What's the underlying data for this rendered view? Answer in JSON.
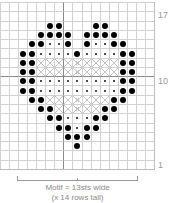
{
  "chart_data": {
    "type": "table",
    "columns": 17,
    "rows": 18,
    "row_labels": [
      {
        "row": 17,
        "label": "17"
      },
      {
        "row": 10,
        "label": "10"
      },
      {
        "row": 1,
        "label": "1"
      }
    ],
    "legend": {
      "B": "large filled dot",
      "s": "small dot",
      "x": "cross (light X)",
      ".": "empty"
    },
    "grid_rows_top_to_bottom": [
      {
        "row": 18,
        "cells": "................."
      },
      {
        "row": 17,
        "cells": "................."
      },
      {
        "row": 16,
        "cells": ".....BB...BB....."
      },
      {
        "row": 15,
        "cells": "....BBBB.BBBB...."
      },
      {
        "row": 14,
        "cells": "...BBssB.BssBB..."
      },
      {
        "row": 13,
        "cells": "..BBssssBssssBB.."
      },
      {
        "row": 12,
        "cells": "..BBxxxxxxxxxBB.."
      },
      {
        "row": 11,
        "cells": "..BBxxxxxxxxxBB.."
      },
      {
        "row": 10,
        "cells": "..BBsssssssssBB.."
      },
      {
        "row": 9,
        "cells": "..BBsssssssssBB.."
      },
      {
        "row": 8,
        "cells": "...BBxxxxxxxBB..."
      },
      {
        "row": 7,
        "cells": "....BBxxxxxBB...."
      },
      {
        "row": 6,
        "cells": ".....BBsssBB....."
      },
      {
        "row": 5,
        "cells": "......BBsBB......"
      },
      {
        "row": 4,
        "cells": ".......BBB......."
      },
      {
        "row": 3,
        "cells": "........B........"
      },
      {
        "row": 2,
        "cells": "................."
      },
      {
        "row": 1,
        "cells": "................."
      }
    ],
    "motif_width_sts": 13,
    "motif_height_rows": 14,
    "thick_lines": {
      "vertical_after_column": 7,
      "horizontal_above_row": 10
    }
  },
  "labels": {
    "row_17": "17",
    "row_10": "10",
    "row_1": "1"
  },
  "caption": {
    "line1": "Motif = 13sts wide",
    "line2": "(x 14 rows tall)"
  },
  "colors": {
    "grid_line": "#d2d2d2",
    "thick_line": "#8a8a8a",
    "dot": "#000000",
    "cross": "#c4c4c4",
    "label_text": "#9a9a9a"
  }
}
